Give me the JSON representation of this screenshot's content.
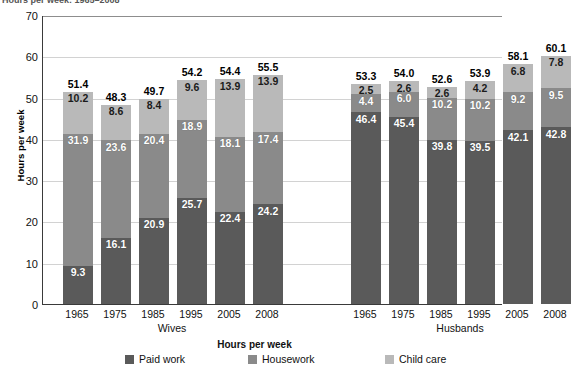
{
  "chart_data": {
    "type": "bar",
    "subtype": "stacked-bar-grouped",
    "title": "Hours per week: 1965–2008",
    "xlabel": "Hours per week",
    "ylabel": "Hours per week",
    "ylim": [
      0,
      70
    ],
    "ytick_step": 10,
    "yticks": [
      "70",
      "60",
      "50",
      "40",
      "30",
      "20",
      "10",
      "0"
    ],
    "grid": true,
    "legend_position": "bottom",
    "legend_title": "Hours per week",
    "categories": [
      "1965",
      "1975",
      "1985",
      "1995",
      "2005",
      "2008"
    ],
    "groups": [
      {
        "name": "Wives",
        "label": "Wives",
        "categories": [
          "1965",
          "1975",
          "1985",
          "1995",
          "2005",
          "2008"
        ],
        "series": [
          {
            "name": "Paid work",
            "values": [
              9.3,
              16.1,
              20.9,
              25.7,
              22.4,
              24.2
            ]
          },
          {
            "name": "Housework",
            "values": [
              31.9,
              23.6,
              20.4,
              18.9,
              18.1,
              17.4
            ]
          },
          {
            "name": "Child care",
            "values": [
              10.2,
              8.6,
              8.4,
              9.6,
              13.9,
              13.9
            ]
          }
        ],
        "totals": [
          51.4,
          48.3,
          49.7,
          54.2,
          54.4,
          55.5
        ]
      },
      {
        "name": "Husbands",
        "label": "Husbands",
        "categories": [
          "1965",
          "1975",
          "1985",
          "1995",
          "2005",
          "2008"
        ],
        "series": [
          {
            "name": "Paid work",
            "values": [
              46.4,
              45.4,
              39.8,
              39.5,
              42.1,
              42.8
            ]
          },
          {
            "name": "Housework",
            "values": [
              4.4,
              6.0,
              10.2,
              10.2,
              9.2,
              9.5
            ]
          },
          {
            "name": "Child care",
            "values": [
              2.5,
              2.6,
              2.6,
              4.2,
              6.8,
              7.8
            ]
          }
        ],
        "totals": [
          53.3,
          54.0,
          52.6,
          53.9,
          58.1,
          60.1
        ]
      }
    ],
    "legend": [
      {
        "name": "Paid work",
        "label": "Paid work",
        "color": "#5a5a5a"
      },
      {
        "name": "Housework",
        "label": "Housework",
        "color": "#8a8a8a"
      },
      {
        "name": "Child care",
        "label": "Child care",
        "color": "#b9b9b9"
      }
    ],
    "colors": {
      "paid_work": "#5a5a5a",
      "housework": "#8a8a8a",
      "child_care": "#b9b9b9",
      "axis": "#3a3a3a",
      "grid": "#d2d2d2",
      "background": "#ffffff"
    }
  }
}
